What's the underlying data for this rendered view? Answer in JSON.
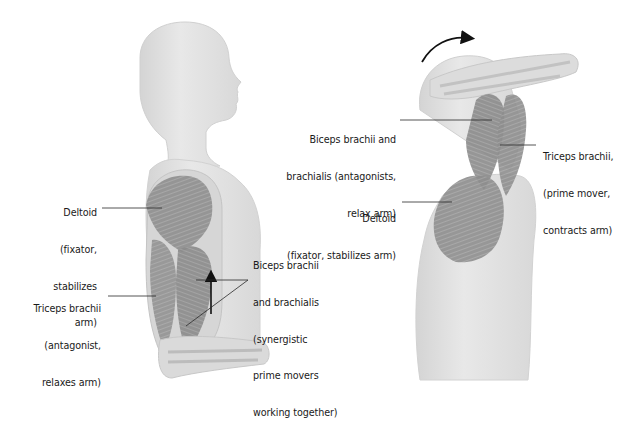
{
  "diagram": {
    "left_figure": {
      "name": "Arm flexion (elbow bent, forearm forward)",
      "labels": {
        "deltoid": [
          "Deltoid",
          "(fixator,",
          "stabilizes",
          "arm)"
        ],
        "triceps": [
          "Triceps brachii",
          "(antagonist,",
          "relaxes arm)"
        ],
        "biceps": [
          "Biceps brachii",
          "and brachialis",
          "(synergistic",
          "prime movers",
          "working together)"
        ]
      },
      "arrow": "up-arrow"
    },
    "right_figure": {
      "name": "Arm extension (arm raised overhead)",
      "labels": {
        "biceps": [
          "Biceps brachii and",
          "brachialis (antagonists,",
          "relax arm)"
        ],
        "deltoid": [
          "Deltoid",
          "(fixator, stabilizes arm)"
        ],
        "triceps": [
          "Triceps brachii,",
          "(prime mover,",
          "contracts arm)"
        ]
      },
      "arrow": "curved-arrow-clockwise"
    },
    "colors": {
      "body": "#e2e2e2",
      "muscle": "#8a8a8a",
      "line": "#2a2a2a",
      "text": "#1a1a1a"
    }
  }
}
